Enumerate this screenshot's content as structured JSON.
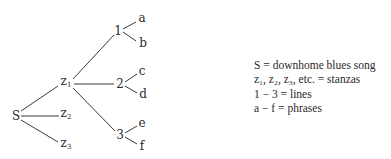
{
  "diagram": {
    "type": "tree",
    "nodes": {
      "root": "S",
      "stanza1": "z",
      "stanza1_sub": "1",
      "stanza2": "z",
      "stanza2_sub": "2",
      "stanza3": "z",
      "stanza3_sub": "3",
      "line1": "1",
      "line2": "2",
      "line3": "3",
      "phrase_a": "a",
      "phrase_b": "b",
      "phrase_c": "c",
      "phrase_d": "d",
      "phrase_e": "e",
      "phrase_f": "f"
    },
    "edges": [
      [
        "S",
        "z1"
      ],
      [
        "S",
        "z2"
      ],
      [
        "S",
        "z3"
      ],
      [
        "z1",
        "1"
      ],
      [
        "z1",
        "2"
      ],
      [
        "z1",
        "3"
      ],
      [
        "1",
        "a"
      ],
      [
        "1",
        "b"
      ],
      [
        "2",
        "c"
      ],
      [
        "2",
        "d"
      ],
      [
        "3",
        "e"
      ],
      [
        "3",
        "f"
      ]
    ],
    "line_color": "#3a3a3a"
  },
  "legend": {
    "items": [
      "S = downhome blues song",
      "z₁, z₂, z₃, etc. = stanzas",
      "1 − 3 = lines",
      "a − f = phrases"
    ]
  }
}
